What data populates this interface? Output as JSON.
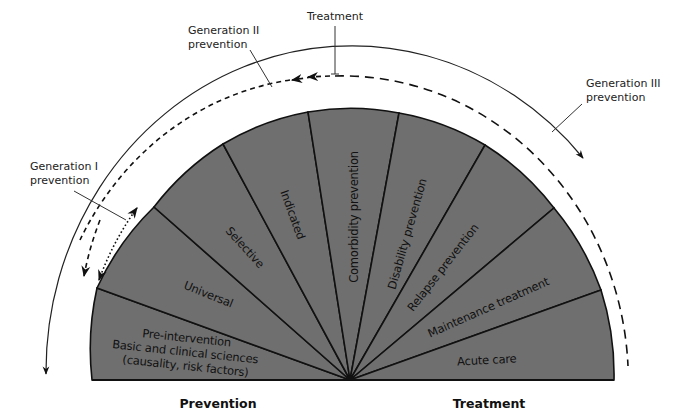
{
  "diagram": {
    "colors": {
      "slice_fill": "#6f6f6f",
      "stroke": "#111111",
      "background": "#ffffff"
    },
    "center": {
      "x": 350,
      "y": 380
    },
    "slices": [
      {
        "id": "pre-intervention",
        "lines": [
          "Pre-intervention",
          "Basic and clinical sciences",
          "(causality, risk factors)"
        ]
      },
      {
        "id": "universal",
        "lines": [
          "Universal"
        ]
      },
      {
        "id": "selective",
        "lines": [
          "Selective"
        ]
      },
      {
        "id": "indicated",
        "lines": [
          "Indicated"
        ]
      },
      {
        "id": "comorbidity-prevention",
        "lines": [
          "Comorbidity prevention"
        ]
      },
      {
        "id": "disability-prevention",
        "lines": [
          "Disability prevention"
        ]
      },
      {
        "id": "relapse-prevention",
        "lines": [
          "Relapse prevention"
        ]
      },
      {
        "id": "maintenance-treatment",
        "lines": [
          "Maintenance treatment"
        ]
      },
      {
        "id": "acute-care",
        "lines": [
          "Acute care"
        ]
      }
    ],
    "callouts": {
      "generation_1": [
        "Generation I",
        "prevention"
      ],
      "generation_2": [
        "Generation II",
        "prevention"
      ],
      "generation_3": [
        "Generation III",
        "prevention"
      ],
      "treatment": [
        "Treatment"
      ]
    },
    "sections": {
      "left": "Prevention",
      "right": "Treatment"
    }
  }
}
